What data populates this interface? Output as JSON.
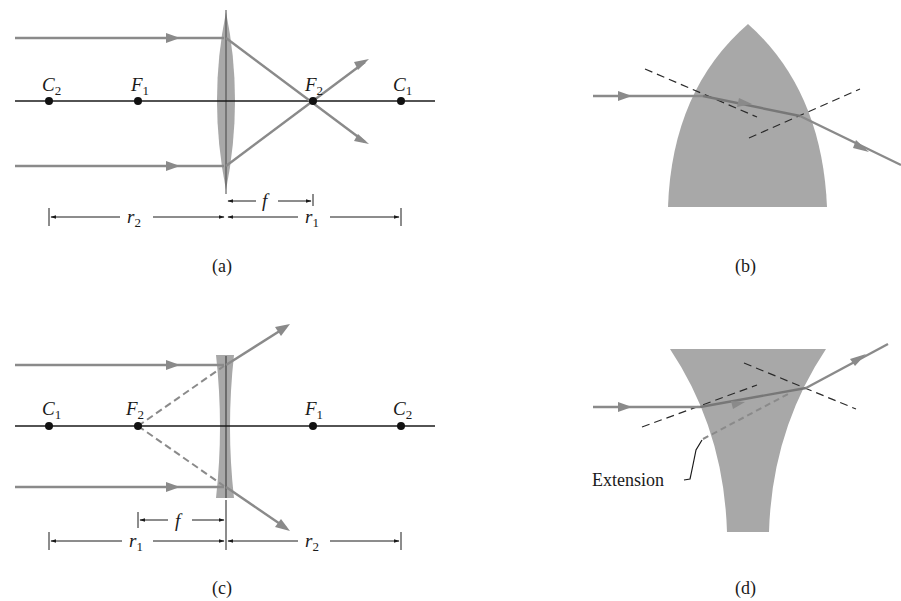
{
  "figure": {
    "panels": [
      {
        "id": "a",
        "caption": "(a)",
        "lens": "converging",
        "points": [
          {
            "name": "C",
            "sub": "2"
          },
          {
            "name": "F",
            "sub": "1"
          },
          {
            "name": "F",
            "sub": "2"
          },
          {
            "name": "C",
            "sub": "1"
          }
        ],
        "dimensions": [
          {
            "name": "r",
            "sub": "2"
          },
          {
            "name": "f",
            "sub": ""
          },
          {
            "name": "r",
            "sub": "1"
          }
        ]
      },
      {
        "id": "b",
        "caption": "(b)",
        "shape": "convex-block"
      },
      {
        "id": "c",
        "caption": "(c)",
        "lens": "diverging",
        "points": [
          {
            "name": "C",
            "sub": "1"
          },
          {
            "name": "F",
            "sub": "2"
          },
          {
            "name": "F",
            "sub": "1"
          },
          {
            "name": "C",
            "sub": "2"
          }
        ],
        "dimensions": [
          {
            "name": "f",
            "sub": ""
          },
          {
            "name": "r",
            "sub": "1"
          },
          {
            "name": "r",
            "sub": "2"
          }
        ]
      },
      {
        "id": "d",
        "caption": "(d)",
        "shape": "concave-block",
        "annotation": "Extension"
      }
    ],
    "colors": {
      "ray": "#8a8a8a",
      "axis": "#1a1a1a",
      "glass": "#a8a8a8",
      "dashed": "#2a2a2a"
    }
  }
}
